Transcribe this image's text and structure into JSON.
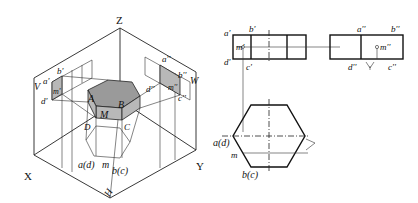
{
  "figure": {
    "left_view": {
      "name": "axonometric-projection",
      "axis_labels": {
        "z": "Z",
        "x": "X",
        "y": "Y",
        "h": "H",
        "v": "V",
        "w": "W"
      },
      "point_labels": {
        "a_prime": "a'",
        "b_prime": "b'",
        "d_prime": "d'",
        "m_prime": "m'",
        "a_dprime": "a''",
        "b_dprime": "b''",
        "c_dprime": "c''",
        "d_dprime": "d''",
        "m_dprime": "m''",
        "A": "A",
        "B": "B",
        "C": "C",
        "D": "D",
        "M": "M",
        "a_d": "a(d)",
        "m": "m",
        "b_c": "b(c)"
      }
    },
    "right_view": {
      "name": "orthographic-projection",
      "front_labels": {
        "a_prime": "a'",
        "b_prime": "b'",
        "m_prime": "m'",
        "d_prime": "d'",
        "c_prime": "c'"
      },
      "side_labels": {
        "a_dprime": "a''",
        "b_dprime": "b''",
        "m_dprime": "m''",
        "d_dprime": "d''",
        "c_dprime": "c''"
      },
      "top_labels": {
        "a_d": "a(d)",
        "m": "m",
        "b_c": "b(c)"
      }
    }
  }
}
